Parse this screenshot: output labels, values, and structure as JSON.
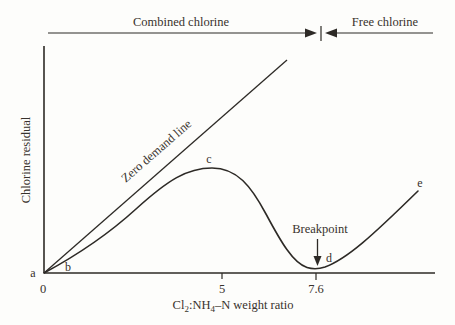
{
  "top_regions": {
    "combined_label": "Combined chlorine",
    "free_label": "Free chlorine"
  },
  "axes": {
    "y_label": "Chlorine residual",
    "x_label": {
      "p0": "Cl",
      "s0": "2",
      "p1": ":NH",
      "s1": "4",
      "p2": "–N weight ratio"
    },
    "x_ticks": {
      "t0": "0",
      "t1": "5",
      "t2": "7.6"
    }
  },
  "points": {
    "a": "a",
    "b": "b",
    "c": "c",
    "d": "d",
    "e": "e"
  },
  "annotations": {
    "zero_demand": "Zero demand line",
    "breakpoint": "Breakpoint"
  },
  "colors": {
    "line": "#2d2a26",
    "text": "#38322c"
  },
  "chart_data": {
    "type": "line",
    "xlabel": "Cl2:NH4–N weight ratio",
    "ylabel": "Chlorine residual",
    "x_tick_values": [
      0,
      5,
      7.6
    ],
    "x_tick_labels": [
      "0",
      "5",
      "7.6"
    ],
    "y_axis_scale": "unlabeled (relative chlorine residual, 0–1)",
    "grid": false,
    "top_span_labels": [
      {
        "label": "Combined chlorine",
        "x_range": [
          0,
          7.6
        ]
      },
      {
        "label": "Free chlorine",
        "x_range": [
          7.6,
          11
        ]
      }
    ],
    "series": [
      {
        "name": "Zero demand line",
        "shape": "straight line from origin",
        "points": [
          {
            "x": 0,
            "y": 0.0
          },
          {
            "x": 6.8,
            "y": 1.0
          }
        ]
      },
      {
        "name": "Chlorine residual curve",
        "shape": "rises to hump at c, drops to breakpoint minimum at d, then rises linearly",
        "points": [
          {
            "label": "a",
            "x": 0,
            "y": 0.0
          },
          {
            "label": "b",
            "x": 0.7,
            "y": 0.04
          },
          {
            "label": "c",
            "x": 4.7,
            "y": 0.49,
            "note": "hump maximum"
          },
          {
            "label": "d",
            "x": 7.6,
            "y": 0.02,
            "note": "breakpoint minimum"
          },
          {
            "label": "e",
            "x": 10.5,
            "y": 0.38,
            "note": "free chlorine residual rising"
          }
        ]
      }
    ],
    "annotations": [
      {
        "text": "Breakpoint",
        "points_to": "d",
        "arrow": "down"
      },
      {
        "text": "Zero demand line",
        "placement": "rotated along zero demand line"
      }
    ],
    "paths_px": {
      "y_axis": "M44,46 L44,273",
      "x_axis": "M44,273 L435,273",
      "tick_5": "M222,273 L222,279",
      "tick_76": "M316,273 L316,280",
      "zero_demand": "M44,273 L287,60",
      "residual_curve": "M44,273 C70,259 102,240 136,209 C168,180 187,168 212,168 C237,168 251,186 266,214 C281,242 293,263 307,267.5 C312,269 319,269 325,267 C347,259 372,236 418,191",
      "combined_line": "M48,33 L308,33",
      "combined_arrowhead": "305,28.5 317,33 305,37.5",
      "divider_bar": "M321,26 L321,41",
      "free_arrowhead": "337,28.5 325,33 337,37.5",
      "free_line": "M334,33 L433,33",
      "breakpoint_arrow_line": "M317.5,239 L317.5,257",
      "breakpoint_arrowhead": "313.5,256 321.5,256 317.5,266"
    }
  }
}
